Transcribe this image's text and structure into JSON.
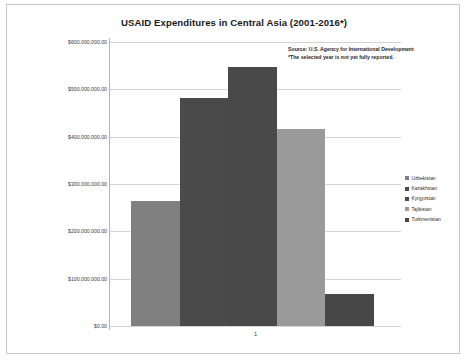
{
  "chart_data": {
    "type": "bar",
    "title": "USAID Expenditures in Central Asia (2001-2016*)",
    "xlabel": "",
    "ylabel": "",
    "categories": [
      "1"
    ],
    "x_tick_labels": [
      "1"
    ],
    "series": [
      {
        "name": "Uzbekistan",
        "values": [
          264000000
        ],
        "color": "#808080"
      },
      {
        "name": "Kazakhstan",
        "values": [
          482000000
        ],
        "color": "#4a4a4a"
      },
      {
        "name": "Kyrgyzstan",
        "values": [
          547000000
        ],
        "color": "#494949"
      },
      {
        "name": "Tajikistan",
        "values": [
          417000000
        ],
        "color": "#9a9a9a"
      },
      {
        "name": "Turkmenistan",
        "values": [
          68000000
        ],
        "color": "#474747"
      }
    ],
    "ylim": [
      0,
      600000000
    ],
    "y_tick_values": [
      600000000,
      500000000,
      400000000,
      300000000,
      200000000,
      100000000,
      0
    ],
    "y_tick_labels": [
      "$600,000,000.00",
      "$500,000,000.00",
      "$400,000,000.00",
      "$300,000,000.00",
      "$200,000,000.00",
      "$100,000,000.00",
      "$0.00"
    ],
    "grid": true,
    "grid_axis": "y",
    "legend_position": "right",
    "annotations": [
      "Source: U.S. Agency for International Development",
      "*The selected year is not yet fully reported."
    ]
  },
  "notes": {
    "source_line": "Source: U.S. Agency for International Development",
    "footnote_line": "*The selected year is not yet fully reported."
  }
}
